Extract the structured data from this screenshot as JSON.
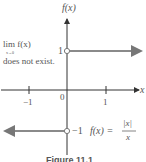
{
  "figure": {
    "y_axis_label": "f(x)",
    "x_axis_label": "x",
    "origin_label": "0",
    "tick_labels": {
      "neg_one_x": "−1",
      "pos_one_x": "1",
      "pos_one_y": "1",
      "neg_one_y": "−1"
    },
    "annotation": {
      "lim_text": "lim f(x)",
      "lim_sub": "x→0",
      "line2": "does not exist."
    },
    "function_label": {
      "lhs": "f(x) =",
      "numerator": "|x|",
      "denominator": "x"
    },
    "caption": "Figure 11.1",
    "colors": {
      "axis": "#333333",
      "graph": "#8a8a8a",
      "text": "#555555"
    }
  }
}
